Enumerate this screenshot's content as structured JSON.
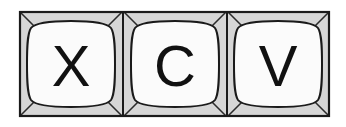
{
  "illustration": {
    "name": "keyboard-shortcut-keys",
    "description": "Three adjacent keyboard keys",
    "background_color": "#ffffff",
    "frame": {
      "border_color": "#1a1a1a",
      "border_width": 2,
      "cell_fill_color": "#d6d6d6",
      "x": 19,
      "y": 11,
      "width": 311,
      "height": 106
    },
    "keycap": {
      "fill_color": "#fbfbfb",
      "outline_color": "#1a1a1a",
      "outline_width": 2
    },
    "diagonal_color": "#2b2b2b",
    "divider_color": "#1a1a1a",
    "keys": [
      {
        "label": "X",
        "name": "key-x",
        "cell_x": 19,
        "cell_width": 104
      },
      {
        "label": "C",
        "name": "key-c",
        "cell_x": 123,
        "cell_width": 104
      },
      {
        "label": "V",
        "name": "key-v",
        "cell_x": 227,
        "cell_width": 103
      }
    ]
  }
}
